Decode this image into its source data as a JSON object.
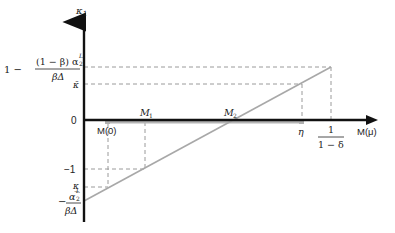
{
  "diagram": {
    "type": "piecewise-linear-function-plot",
    "y_axis": {
      "label": "κ",
      "label_sub": "1"
    },
    "x_axis": {
      "label": "M(μ)"
    },
    "y_ticks": {
      "top": {
        "prefix": "1 −",
        "num": "(1 − β) α",
        "num_sup": "L",
        "num_sub": "2",
        "den": "βΔ"
      },
      "kappa_bar": "κ̄",
      "zero": "0",
      "minus_one": "−1",
      "kappa_under": "κ̲",
      "bottom": {
        "prefix": "−",
        "num": "α",
        "num_sup": "L",
        "num_sub": "2",
        "den": "βΔ"
      }
    },
    "x_ticks": {
      "m0": "M(0)",
      "m1": "M",
      "m1_sub": "1",
      "m2": "M",
      "m2_sub": "2",
      "eta": "η",
      "end": {
        "num": "1",
        "den": "1 − δ"
      }
    },
    "colors": {
      "axis": "#111111",
      "line": "#a8a8a8",
      "dash": "#9a9a9a",
      "text": "#222222"
    }
  }
}
